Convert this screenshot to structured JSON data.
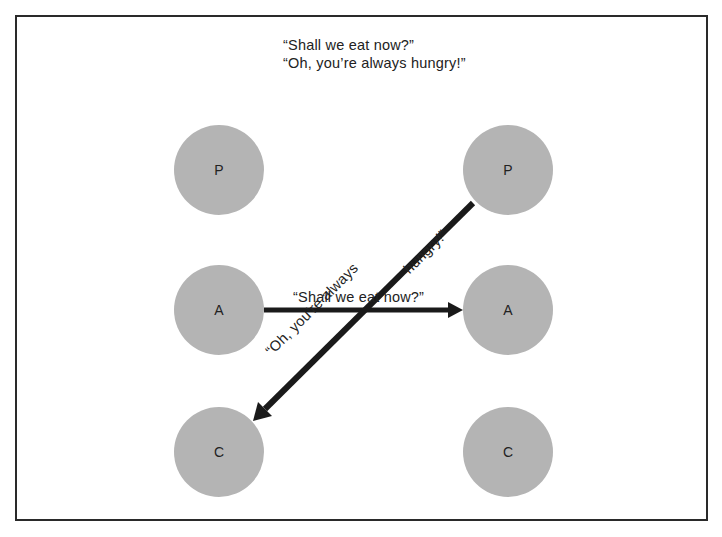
{
  "caption": {
    "line1": "“Shall we eat now?”",
    "line2": "“Oh, you’re always hungry!”"
  },
  "left_column": {
    "parent": "P",
    "adult": "A",
    "child": "C"
  },
  "right_column": {
    "parent": "P",
    "adult": "A",
    "child": "C"
  },
  "transactions": {
    "stimulus": {
      "label": "“Shall we eat now?”",
      "from": "left-A",
      "to": "right-A"
    },
    "response": {
      "label_part1": "“Oh, you’re always",
      "label_part2": "hungry!”",
      "from": "right-P",
      "to": "left-C"
    }
  },
  "colors": {
    "node_fill": "#b4b4b4",
    "arrow": "#1a1a1a",
    "border": "#2a2a2a"
  }
}
